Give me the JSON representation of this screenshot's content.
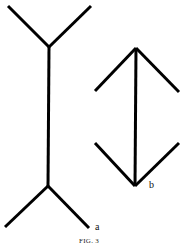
{
  "figure": {
    "caption": "FIG. 3",
    "labels": {
      "a": "a",
      "b": "b"
    },
    "stroke_color": "#000000",
    "figure_a": {
      "description": "vertical line with outward (fins-out) arrowheads",
      "shaft": [
        [
          49,
          47
        ],
        [
          48,
          186
        ]
      ],
      "top_fins": [
        [
          [
            8,
            6
          ],
          [
            49,
            47
          ]
        ],
        [
          [
            91,
            6
          ],
          [
            49,
            47
          ]
        ]
      ],
      "bottom_fins": [
        [
          [
            48,
            186
          ],
          [
            5,
            227
          ]
        ],
        [
          [
            48,
            186
          ],
          [
            89,
            228
          ]
        ]
      ]
    },
    "figure_b": {
      "description": "vertical line with inward (fins-in) arrowheads",
      "shaft": [
        [
          136,
          48
        ],
        [
          135,
          186
        ]
      ],
      "top_fins": [
        [
          [
            136,
            48
          ],
          [
            95,
            91
          ]
        ],
        [
          [
            136,
            48
          ],
          [
            179,
            92
          ]
        ]
      ],
      "bottom_fins": [
        [
          [
            95,
            143
          ],
          [
            135,
            186
          ]
        ],
        [
          [
            179,
            143
          ],
          [
            135,
            186
          ]
        ]
      ]
    }
  }
}
